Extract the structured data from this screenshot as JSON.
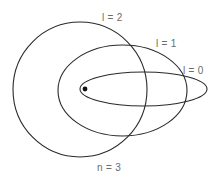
{
  "diagram": {
    "labels": {
      "l2": "l = 2",
      "l1": "l = 1",
      "l0": "l = 0",
      "n": "n = 3"
    },
    "orbits": [
      {
        "name": "l = 2",
        "shape": "circle",
        "cx": 80,
        "cy": 89.5,
        "rx": 67,
        "ry": 67.5
      },
      {
        "name": "l = 1",
        "shape": "ellipse",
        "cx": 122.5,
        "cy": 90.5,
        "rx": 64.5,
        "ry": 45.5
      },
      {
        "name": "l = 0",
        "shape": "ellipse",
        "cx": 143.5,
        "cy": 89,
        "rx": 63.5,
        "ry": 17
      }
    ],
    "nucleus": {
      "cx": 85,
      "cy": 89,
      "r": 2.4
    },
    "colors": {
      "stroke": "#2a2a2a",
      "label": "#6b6b6b",
      "nucleus": "#111111",
      "background": "#ffffff"
    }
  }
}
